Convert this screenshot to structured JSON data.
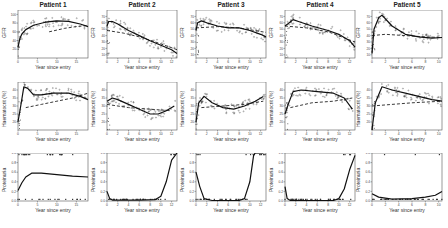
{
  "chart_data": {
    "type": "line",
    "layout": {
      "rows": 3,
      "cols": 5,
      "row_variables": [
        "GFR",
        "Haematocrit (%)",
        "Proteinuria"
      ]
    },
    "xlabel": "Year since entry",
    "legend": "none",
    "grid": false,
    "series_styles": {
      "observed": "points",
      "fitted_subject": "solid line",
      "population_mean": "dashed line"
    },
    "patients": [
      {
        "title": "Patient 1",
        "xlim": [
          0,
          18
        ],
        "xticks": [
          0,
          5,
          10,
          15
        ],
        "gfr": {
          "ylabel": "GFR",
          "ylim": [
            0,
            110
          ],
          "yticks": [
            20,
            40,
            60,
            80,
            100
          ],
          "solid": [
            [
              0,
              25
            ],
            [
              0.5,
              45
            ],
            [
              1,
              55
            ],
            [
              2,
              65
            ],
            [
              4,
              75
            ],
            [
              7,
              82
            ],
            [
              10,
              85
            ],
            [
              13,
              84
            ],
            [
              16,
              78
            ],
            [
              18,
              72
            ]
          ],
          "dashed": [
            [
              8,
              60
            ],
            [
              12,
              68
            ],
            [
              15,
              72
            ],
            [
              18,
              75
            ]
          ]
        },
        "hct": {
          "ylabel": "Haematocrit (%)",
          "ylim": [
            15,
            45
          ],
          "yticks": [
            20,
            25,
            30,
            35,
            40
          ],
          "solid": [
            [
              0,
              20
            ],
            [
              0.7,
              30
            ],
            [
              1.5,
              42
            ],
            [
              2.5,
              41
            ],
            [
              4,
              37
            ],
            [
              6,
              37
            ],
            [
              9,
              38
            ],
            [
              13,
              38
            ],
            [
              16,
              36
            ],
            [
              18,
              34
            ]
          ],
          "dashed": [
            [
              2,
              29
            ],
            [
              6,
              31
            ],
            [
              10,
              33
            ],
            [
              14,
              35
            ],
            [
              18,
              38
            ]
          ]
        },
        "prot": {
          "ylabel": "Proteinuria",
          "ylim": [
            0,
            1
          ],
          "yticks": [
            0.0,
            0.2,
            0.4,
            0.6,
            0.8,
            1.0
          ],
          "solid": [
            [
              0,
              0.22
            ],
            [
              1,
              0.38
            ],
            [
              2,
              0.5
            ],
            [
              3.5,
              0.58
            ],
            [
              6,
              0.58
            ],
            [
              10,
              0.55
            ],
            [
              14,
              0.52
            ],
            [
              18,
              0.5
            ]
          ]
        }
      },
      {
        "title": "Patient 2",
        "xlim": [
          0,
          13
        ],
        "xticks": [
          0,
          2,
          4,
          6,
          8,
          10,
          12
        ],
        "gfr": {
          "ylabel": "GFR",
          "ylim": [
            5,
            80
          ],
          "yticks": [
            10,
            20,
            30,
            40,
            50,
            60,
            70
          ],
          "solid": [
            [
              0,
              55
            ],
            [
              0.3,
              62
            ],
            [
              1,
              62
            ],
            [
              2,
              58
            ],
            [
              4,
              48
            ],
            [
              6,
              40
            ],
            [
              8,
              32
            ],
            [
              10,
              25
            ],
            [
              12,
              18
            ],
            [
              13,
              12
            ]
          ],
          "dashed": [
            [
              0,
              48
            ],
            [
              3,
              44
            ],
            [
              6,
              38
            ],
            [
              9,
              30
            ],
            [
              13,
              18
            ]
          ]
        },
        "hct": {
          "ylabel": "Haematocrit (%)",
          "ylim": [
            15,
            45
          ],
          "yticks": [
            20,
            25,
            30,
            35,
            40
          ],
          "solid": [
            [
              0,
              33
            ],
            [
              1,
              35
            ],
            [
              2,
              34
            ],
            [
              4,
              31
            ],
            [
              6,
              28
            ],
            [
              8,
              25
            ],
            [
              9.5,
              25
            ],
            [
              11,
              27
            ],
            [
              12.5,
              30
            ]
          ],
          "dashed": [
            [
              0,
              31
            ],
            [
              4,
              29
            ],
            [
              8,
              28
            ],
            [
              12,
              27
            ]
          ]
        },
        "prot": {
          "ylabel": "Proteinuria",
          "ylim": [
            0,
            1
          ],
          "yticks": [
            0.0,
            0.2,
            0.4,
            0.6,
            0.8,
            1.0
          ],
          "solid": [
            [
              0,
              0.2
            ],
            [
              0.5,
              0.05
            ],
            [
              1,
              0.02
            ],
            [
              6,
              0.02
            ],
            [
              9,
              0.03
            ],
            [
              10,
              0.1
            ],
            [
              11,
              0.4
            ],
            [
              12,
              0.85
            ],
            [
              13,
              1.0
            ]
          ]
        }
      },
      {
        "title": "Patient 3",
        "xlim": [
          0,
          13
        ],
        "xticks": [
          0,
          2,
          4,
          6,
          8,
          10,
          12
        ],
        "gfr": {
          "ylabel": "GFR",
          "ylim": [
            5,
            80
          ],
          "yticks": [
            10,
            20,
            30,
            40,
            50,
            60,
            70
          ],
          "solid": [
            [
              0,
              48
            ],
            [
              0.3,
              60
            ],
            [
              1,
              63
            ],
            [
              2,
              60
            ],
            [
              4,
              55
            ],
            [
              6,
              52
            ],
            [
              8,
              52
            ],
            [
              10,
              48
            ],
            [
              12,
              42
            ],
            [
              13,
              38
            ]
          ],
          "dashed": [
            [
              0,
              52
            ],
            [
              4,
              54
            ],
            [
              8,
              52
            ],
            [
              13,
              45
            ]
          ]
        },
        "hct": {
          "ylabel": "Haematocrit (%)",
          "ylim": [
            15,
            45
          ],
          "yticks": [
            20,
            25,
            30,
            35,
            40
          ],
          "solid": [
            [
              0,
              20
            ],
            [
              0.5,
              32
            ],
            [
              1.5,
              36
            ],
            [
              3,
              32
            ],
            [
              5,
              29
            ],
            [
              7,
              28
            ],
            [
              9,
              30
            ],
            [
              11,
              33
            ],
            [
              12.5,
              36
            ]
          ],
          "dashed": [
            [
              1,
              29
            ],
            [
              5,
              30
            ],
            [
              9,
              31
            ],
            [
              12.5,
              33
            ]
          ]
        },
        "prot": {
          "ylabel": "Proteinuria",
          "ylim": [
            0,
            1
          ],
          "yticks": [
            0.0,
            0.2,
            0.4,
            0.6,
            0.8,
            1.0
          ],
          "solid": [
            [
              0,
              0.6
            ],
            [
              0.7,
              0.3
            ],
            [
              1.5,
              0.05
            ],
            [
              3,
              0.01
            ],
            [
              8,
              0.01
            ],
            [
              9,
              0.05
            ],
            [
              10,
              0.4
            ],
            [
              10.7,
              0.95
            ],
            [
              11,
              1.0
            ],
            [
              12.5,
              1.0
            ]
          ]
        }
      },
      {
        "title": "Patient 4",
        "xlim": [
          0,
          13
        ],
        "xticks": [
          0,
          2,
          4,
          6,
          8,
          10,
          12
        ],
        "gfr": {
          "ylabel": "GFR",
          "ylim": [
            5,
            80
          ],
          "yticks": [
            10,
            20,
            30,
            40,
            50,
            60,
            70
          ],
          "solid": [
            [
              0,
              55
            ],
            [
              0.5,
              58
            ],
            [
              1.5,
              65
            ],
            [
              2.5,
              62
            ],
            [
              5,
              55
            ],
            [
              8,
              48
            ],
            [
              10,
              42
            ],
            [
              12,
              32
            ],
            [
              13,
              22
            ]
          ],
          "dashed": [
            [
              0,
              55
            ],
            [
              4,
              52
            ],
            [
              8,
              46
            ],
            [
              13,
              30
            ]
          ]
        },
        "hct": {
          "ylabel": "Haematocrit (%)",
          "ylim": [
            15,
            45
          ],
          "yticks": [
            20,
            25,
            30,
            35,
            40
          ],
          "solid": [
            [
              0,
              25
            ],
            [
              0.7,
              32
            ],
            [
              1.5,
              39
            ],
            [
              3,
              40
            ],
            [
              6,
              39
            ],
            [
              9,
              38
            ],
            [
              11,
              35
            ],
            [
              12.5,
              28
            ]
          ],
          "dashed": [
            [
              1,
              29
            ],
            [
              5,
              32
            ],
            [
              9,
              33
            ],
            [
              12.5,
              35
            ]
          ]
        },
        "prot": {
          "ylabel": "Proteinuria",
          "ylim": [
            0,
            1
          ],
          "yticks": [
            0.0,
            0.2,
            0.4,
            0.6,
            0.8,
            1.0
          ],
          "solid": [
            [
              0,
              0.3
            ],
            [
              0.4,
              0.05
            ],
            [
              1,
              0.01
            ],
            [
              9,
              0.01
            ],
            [
              10,
              0.05
            ],
            [
              11,
              0.25
            ],
            [
              12,
              0.65
            ],
            [
              13,
              0.95
            ]
          ]
        }
      },
      {
        "title": "Patient 5",
        "xlim": [
          0,
          10.5
        ],
        "xticks": [
          0,
          2,
          4,
          6,
          8,
          10
        ],
        "gfr": {
          "ylabel": "GFR",
          "ylim": [
            5,
            80
          ],
          "yticks": [
            10,
            20,
            30,
            40,
            50,
            60,
            70
          ],
          "solid": [
            [
              0,
              12
            ],
            [
              0.3,
              50
            ],
            [
              1,
              68
            ],
            [
              1.5,
              72
            ],
            [
              3,
              55
            ],
            [
              5,
              42
            ],
            [
              7,
              38
            ],
            [
              9,
              36
            ],
            [
              10.5,
              37
            ]
          ],
          "dashed": [
            [
              0,
              40
            ],
            [
              2,
              42
            ],
            [
              5,
              40
            ],
            [
              8,
              38
            ],
            [
              10.5,
              37
            ]
          ]
        },
        "hct": {
          "ylabel": "Haematocrit (%)",
          "ylim": [
            15,
            45
          ],
          "yticks": [
            20,
            25,
            30,
            35,
            40
          ],
          "solid": [
            [
              0,
              15
            ],
            [
              0.5,
              32
            ],
            [
              1.5,
              42
            ],
            [
              3,
              40
            ],
            [
              5,
              38
            ],
            [
              7,
              36
            ],
            [
              9,
              34
            ],
            [
              10.5,
              33
            ]
          ],
          "dashed": [
            [
              0,
              30
            ],
            [
              3,
              31
            ],
            [
              6,
              32
            ],
            [
              10.5,
              33
            ]
          ]
        },
        "prot": {
          "ylabel": "Proteinuria",
          "ylim": [
            0,
            1
          ],
          "yticks": [
            0.0,
            0.2,
            0.4,
            0.6,
            0.8,
            1.0
          ],
          "solid": [
            [
              0,
              0.15
            ],
            [
              1,
              0.08
            ],
            [
              3,
              0.04
            ],
            [
              6,
              0.05
            ],
            [
              8,
              0.08
            ],
            [
              9.5,
              0.12
            ],
            [
              10.5,
              0.2
            ]
          ]
        }
      }
    ]
  }
}
